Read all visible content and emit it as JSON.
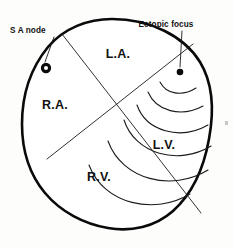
{
  "figure": {
    "background_color": "#fdfdfb",
    "stroke_color": "#0a0a0a",
    "width": 234,
    "height": 248
  },
  "chambers": [
    {
      "id": "left-atrium",
      "label": "L.A.",
      "x": 118,
      "y": 58
    },
    {
      "id": "right-atrium",
      "label": "R.A.",
      "x": 55,
      "y": 109
    },
    {
      "id": "left-ventricle",
      "label": "L.V.",
      "x": 164,
      "y": 149
    },
    {
      "id": "right-ventricle",
      "label": "R.V.",
      "x": 99,
      "y": 181
    }
  ],
  "callouts": [
    {
      "id": "sa-node",
      "label": "S A node",
      "marker": "ring",
      "label_x": 10,
      "label_y": 33,
      "marker_x": 46,
      "marker_y": 68,
      "leader_from_x": 54,
      "leader_from_y": 37,
      "leader_to_x": 45,
      "leader_to_y": 62
    },
    {
      "id": "ectopic-focus",
      "label": "Ectopic focus",
      "marker": "dot",
      "label_x": 166,
      "label_y": 27,
      "marker_x": 180,
      "marker_y": 72,
      "leader_from_x": 182,
      "leader_from_y": 31,
      "leader_to_x": 180,
      "leader_to_y": 67
    }
  ],
  "dividers": [
    {
      "id": "interventricular-septum",
      "x1": 62,
      "y1": 34,
      "x2": 201,
      "y2": 213
    },
    {
      "id": "atrioventricular-groove",
      "x1": 47,
      "y1": 159,
      "x2": 193,
      "y2": 44
    }
  ],
  "wave_arcs": {
    "origin_x": 180,
    "origin_y": 72,
    "count": 6,
    "description": "concentric excitation wavefronts spreading from the ectopic focus"
  },
  "colors": {
    "ink": "#0a0a0a",
    "thin_ink": "#1a1a1a",
    "paper": "#fdfdfb"
  }
}
